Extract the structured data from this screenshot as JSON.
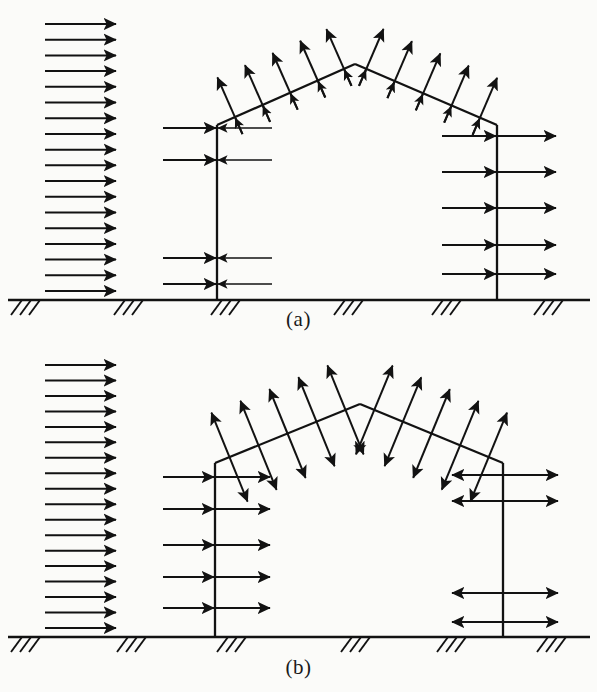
{
  "figure": {
    "background_color": "#fbfbf9",
    "ink_color": "#121212"
  },
  "panels": [
    {
      "id": "a",
      "caption": "(a)",
      "caption_x": 298,
      "caption_y": 307,
      "description": "Windward wall pressure, roof suction, leeward wall suction",
      "frame": {
        "left_column_x": 217,
        "right_column_x": 497,
        "eave_y": 125,
        "apex_x": 355,
        "apex_y": 64,
        "base_y": 300
      },
      "ground": {
        "y": 300,
        "x_start": 8,
        "x_end": 590,
        "hatch_groups_x": [
          22,
          125,
          222,
          345,
          443,
          545
        ],
        "hatch_count_per_group": 3
      },
      "wind_profile": {
        "type": "uniform",
        "direction": "right",
        "arrow_count": 18,
        "tip_x": 116,
        "tail_x": 45,
        "y_top": 24,
        "y_bottom": 291,
        "label": "incident wind velocity profile"
      },
      "left_column_loads": {
        "pattern": "converging-pair",
        "direction": "pressure-inward",
        "count": 4,
        "rows_y": [
          128,
          160,
          258,
          284
        ],
        "left_tail_x": 163,
        "right_tail_x": 272,
        "column_x": 217
      },
      "right_column_loads": {
        "pattern": "same-direction-pair",
        "direction": "right-suction",
        "count": 5,
        "rows_y": [
          136,
          172,
          208,
          245,
          274
        ],
        "left_tail_x": 442,
        "right_tip_x": 556,
        "column_x": 497
      },
      "roof_loads": {
        "pattern": "outward-normal",
        "direction": "suction",
        "arrow_count_left_slope": 5,
        "arrow_count_right_slope": 5,
        "arrow_length": 62,
        "left_slope_stations": [
          0.13,
          0.33,
          0.53,
          0.73,
          0.92
        ],
        "right_slope_stations": [
          0.08,
          0.28,
          0.48,
          0.68,
          0.88
        ]
      }
    },
    {
      "id": "b",
      "caption": "(b)",
      "caption_x": 298,
      "caption_y": 655,
      "description": "Windward wall pressure, roof double suction, leeward wall double suction",
      "frame": {
        "left_column_x": 215,
        "right_column_x": 503,
        "eave_y": 463,
        "apex_x": 360,
        "apex_y": 404,
        "base_y": 637
      },
      "ground": {
        "y": 637,
        "x_start": 8,
        "x_end": 590,
        "hatch_groups_x": [
          22,
          128,
          228,
          352,
          448,
          548
        ],
        "hatch_count_per_group": 3
      },
      "wind_profile": {
        "type": "uniform",
        "direction": "right",
        "arrow_count": 18,
        "tip_x": 116,
        "tail_x": 45,
        "y_top": 365,
        "y_bottom": 628,
        "label": "incident wind velocity profile"
      },
      "left_column_loads": {
        "pattern": "same-direction-pair",
        "direction": "right-pressure",
        "count": 5,
        "rows_y": [
          477,
          509,
          545,
          577,
          608
        ],
        "left_tail_x": 163,
        "right_tip_x": 270,
        "column_x": 215
      },
      "right_column_loads": {
        "pattern": "diverging-pair",
        "direction": "suction-outward",
        "count": 4,
        "rows_y": [
          475,
          501,
          593,
          622
        ],
        "left_tip_x": 452,
        "right_tip_x": 558,
        "column_x": 503
      },
      "roof_loads": {
        "pattern": "double-headed-normal",
        "direction": "suction-both-ends",
        "arrow_count_left_slope": 5,
        "arrow_count_right_slope": 5,
        "arrow_length": 96,
        "left_slope_stations": [
          0.1,
          0.3,
          0.5,
          0.7,
          0.9
        ],
        "right_slope_stations": [
          0.1,
          0.3,
          0.5,
          0.7,
          0.9
        ]
      }
    }
  ]
}
